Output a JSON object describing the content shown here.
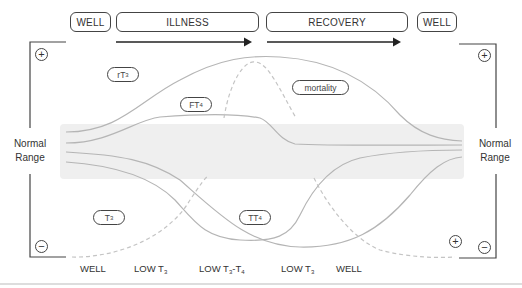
{
  "phases": {
    "top": [
      {
        "label": "WELL"
      },
      {
        "label": "ILLNESS"
      },
      {
        "label": "RECOVERY"
      },
      {
        "label": "WELL"
      }
    ]
  },
  "side_labels": {
    "left": {
      "line1": "Normal",
      "line2": "Range"
    },
    "right": {
      "line1": "Normal",
      "line2": "Range"
    }
  },
  "signs": {
    "plus": "+",
    "minus": "−"
  },
  "curve_tags": {
    "rt3": {
      "main": "rT",
      "sub": "3"
    },
    "ft4": {
      "main": "FT",
      "sub": "4"
    },
    "mortality": {
      "main": "mortality"
    },
    "t3": {
      "main": "T",
      "sub": "3"
    },
    "tt4": {
      "main": "TT",
      "sub": "4"
    }
  },
  "bottom_labels": [
    {
      "main": "WELL",
      "sub": ""
    },
    {
      "main": "LOW T",
      "sub": "3"
    },
    {
      "main": "LOW T",
      "sub": "3",
      "tail": "-T",
      "tail_sub": "4"
    },
    {
      "main": "LOW T",
      "sub": "3"
    },
    {
      "main": "WELL",
      "sub": ""
    }
  ],
  "colors": {
    "normal_range_band": "#efefef",
    "curve": "#b5b5b5",
    "dashed_curve": "#c4c4c4",
    "frame": "#444444",
    "divider": "#bbbbbb"
  }
}
